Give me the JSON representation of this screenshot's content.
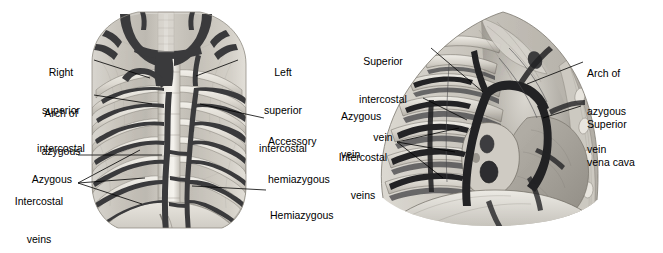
{
  "figure": {
    "type": "anatomical-illustration",
    "panel_count": 2,
    "style": "grayscale pencil/wash medical illustration",
    "background_color": "#ffffff",
    "ink_color": "#000000"
  },
  "left_panel": {
    "name": "posterior-thoracic-wall-azygous-system",
    "view": "anterior view of posterior thoracic wall with vertebral column, ribs and azygous venous system",
    "labels": [
      {
        "id": "right-superior-intercostal",
        "text": "Right\nsuperior\nintercostal",
        "lines": [
          "Right",
          "superior",
          "intercostal"
        ],
        "align": "center",
        "side": "left"
      },
      {
        "id": "arch-of-azygous",
        "text": "Arch of\nazygous",
        "lines": [
          "Arch of",
          "azygous"
        ],
        "align": "center",
        "side": "left"
      },
      {
        "id": "azygous",
        "text": "Azygous",
        "lines": [
          "Azygous"
        ],
        "align": "right",
        "side": "left"
      },
      {
        "id": "intercostal-veins",
        "text": "Intercostal\nveins",
        "lines": [
          "Intercostal",
          "veins"
        ],
        "align": "center",
        "side": "left"
      },
      {
        "id": "left-superior-intercostal",
        "text": "Left\nsuperior\nintercostal",
        "lines": [
          "Left",
          "superior",
          "intercostal"
        ],
        "align": "center",
        "side": "right"
      },
      {
        "id": "accessory-hemiazygous",
        "text": "Accessory\nhemiazygous",
        "lines": [
          "Accessory",
          "hemiazygous"
        ],
        "align": "left",
        "side": "right"
      },
      {
        "id": "hemiazygous",
        "text": "Hemiazygous",
        "lines": [
          "Hemiazygous"
        ],
        "align": "left",
        "side": "right"
      }
    ]
  },
  "right_panel": {
    "name": "right-thoracic-cavity-lateral-view",
    "view": "right lateral view of opened thorax showing ribs, azygous vein, superior vena cava and diaphragm",
    "labels": [
      {
        "id": "superior-intercostal-vein",
        "text": "Superior\nintercostal\nvein",
        "lines": [
          "Superior",
          "intercostal",
          "vein"
        ],
        "align": "center",
        "side": "left"
      },
      {
        "id": "azygous-vein",
        "text": "Azygous\nvein",
        "lines": [
          "Azygous",
          "vein"
        ],
        "align": "left",
        "side": "left"
      },
      {
        "id": "intercostal-veins",
        "text": "Intercostal\nveins",
        "lines": [
          "Intercostal",
          "veins"
        ],
        "align": "center",
        "side": "left"
      },
      {
        "id": "arch-of-azygous-vein",
        "text": "Arch of\nazygous\nvein",
        "lines": [
          "Arch of",
          "azygous",
          "vein"
        ],
        "align": "left",
        "side": "right"
      },
      {
        "id": "superior-vena-cava",
        "text": "Superior\nvena cava",
        "lines": [
          "Superior",
          "vena cava"
        ],
        "align": "left",
        "side": "right"
      }
    ]
  }
}
